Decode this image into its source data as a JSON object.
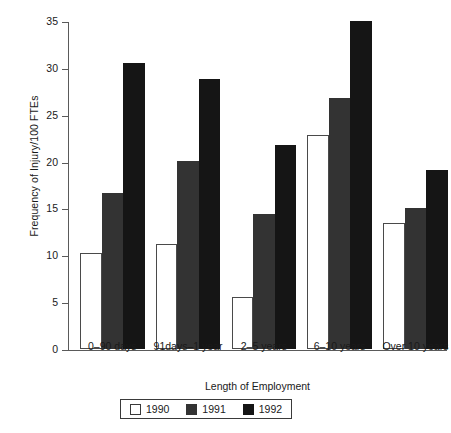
{
  "chart_data": {
    "type": "bar",
    "title": "",
    "xlabel": "Length of Employment",
    "ylabel": "Frequency of Injury/100 FTEs",
    "categories": [
      "0–90 days",
      "91days–1 year",
      "2–5 years",
      "6–10 years",
      "Over 10 years"
    ],
    "series": [
      {
        "name": "1990",
        "color": "#ffffff",
        "values": [
          10.2,
          11.2,
          5.6,
          22.8,
          13.5
        ]
      },
      {
        "name": "1991",
        "color": "#333333",
        "values": [
          16.6,
          20.1,
          14.4,
          26.8,
          15.1
        ]
      },
      {
        "name": "1992",
        "color": "#151515",
        "values": [
          30.5,
          28.8,
          21.8,
          35.0,
          19.1
        ]
      }
    ],
    "ylim": [
      0,
      35
    ],
    "yticks": [
      0,
      5,
      10,
      15,
      20,
      25,
      30,
      35
    ],
    "ytick_labels": [
      "0",
      "5",
      "10",
      "15",
      "20",
      "25",
      "30",
      "35"
    ],
    "grid": false,
    "legend_position": "bottom",
    "legend_entries": [
      "1990",
      "1991",
      "1992"
    ]
  }
}
